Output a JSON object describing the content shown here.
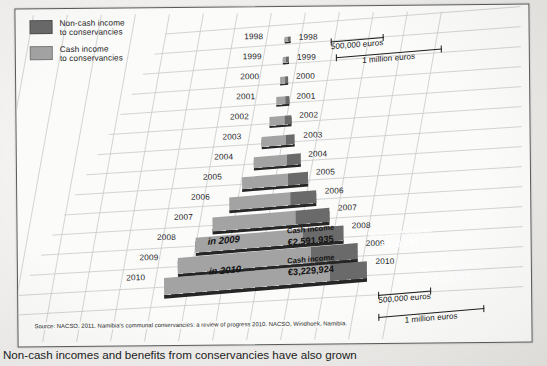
{
  "legend": {
    "items": [
      {
        "label_line1": "Non-cash income",
        "label_line2": "to conservancies",
        "color": "#6a6a6a",
        "key": "non-cash"
      },
      {
        "label_line1": "Cash income",
        "label_line2": "to conservancies",
        "color": "#a3a3a3",
        "key": "cash"
      }
    ]
  },
  "axis": {
    "years_left": [
      "1998",
      "1999",
      "2000",
      "2001",
      "2002",
      "2003",
      "2004",
      "2005",
      "2006",
      "2007",
      "2008",
      "2009",
      "2010"
    ],
    "years_right": [
      "1998",
      "1999",
      "2000",
      "2001",
      "2002",
      "2003",
      "2004",
      "2005",
      "2006",
      "2007",
      "2008",
      "2009",
      "2010"
    ]
  },
  "scales": {
    "top": [
      {
        "label": "500,000 euros"
      },
      {
        "label": "1 million euros"
      }
    ],
    "bottom": [
      {
        "label": "500,000 euros"
      },
      {
        "label": "1 million euros"
      }
    ]
  },
  "annotations": {
    "year_2009_tag": "in 2009",
    "year_2010_tag": "in 2010",
    "cash_2009_title": "Cash income",
    "cash_2009_value": "€2,591,935",
    "noncash_2009_title": "Non-cash income",
    "noncash_2009_value": "€910,251",
    "cash_2010_title": "Cash income",
    "cash_2010_value": "€3,229,924",
    "noncash_2010_title": "Non-cash income",
    "noncash_2010_value": "€717,012"
  },
  "source": "Source: NACSO. 2011. Namibia's communal conservancies: a review of progress 2010. NACSO, Windhoek, Namibia.",
  "caption": "Non-cash incomes and benefits from conservancies have also grown",
  "colors": {
    "cash": "#a3a3a3",
    "noncash": "#6a6a6a",
    "frame": "#5b5b5b",
    "grid": "#c9c9c9"
  },
  "chart_data": {
    "type": "bar",
    "xlabel": "Income (euros)",
    "ylabel": "Year",
    "unit": "euros",
    "grid": true,
    "legend_position": "top-left",
    "orientation": "horizontal-stacked-pyramid",
    "xlim": [
      0,
      4200000
    ],
    "categories": [
      "1998",
      "1999",
      "2000",
      "2001",
      "2002",
      "2003",
      "2004",
      "2005",
      "2006",
      "2007",
      "2008",
      "2009",
      "2010"
    ],
    "series": [
      {
        "name": "Cash income to conservancies",
        "color": "#a3a3a3",
        "values": [
          20000,
          45000,
          90000,
          175000,
          300000,
          460000,
          640000,
          900000,
          1190000,
          1620000,
          2080000,
          2591935,
          3229924
        ]
      },
      {
        "name": "Non-cash income to conservancies",
        "color": "#6a6a6a",
        "values": [
          8000,
          18000,
          38000,
          70000,
          120000,
          190000,
          270000,
          380000,
          500000,
          660000,
          800000,
          910251,
          717012
        ]
      }
    ],
    "labelled_points": [
      {
        "category": "2009",
        "series": "Cash income to conservancies",
        "label": "€2,591,935",
        "value": 2591935
      },
      {
        "category": "2009",
        "series": "Non-cash income to conservancies",
        "label": "€910,251",
        "value": 910251
      },
      {
        "category": "2010",
        "series": "Cash income to conservancies",
        "label": "€3,229,924",
        "value": 3229924
      },
      {
        "category": "2010",
        "series": "Non-cash income to conservancies",
        "label": "€717,012",
        "value": 717012
      }
    ]
  }
}
